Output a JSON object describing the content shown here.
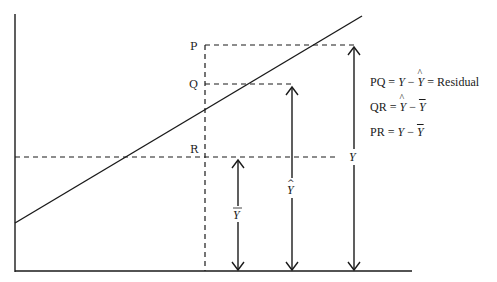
{
  "diagram": {
    "points": {
      "P": "P",
      "Q": "Q",
      "R": "R"
    },
    "arrow_labels": {
      "y_bar": "Y",
      "y_hat": "Y",
      "y": "Y"
    },
    "legend": [
      {
        "lhs": "PQ",
        "eq": " = ",
        "a": "Y",
        "minus": " − ",
        "b": "Y",
        "eq2": " = ",
        "tail": "Residual"
      },
      {
        "lhs": "QR",
        "eq": " = ",
        "a": "Y",
        "minus": " − ",
        "b": "Y"
      },
      {
        "lhs": "PR",
        "eq": " = ",
        "a": "Y",
        "minus": " − ",
        "b": "Y"
      }
    ]
  }
}
